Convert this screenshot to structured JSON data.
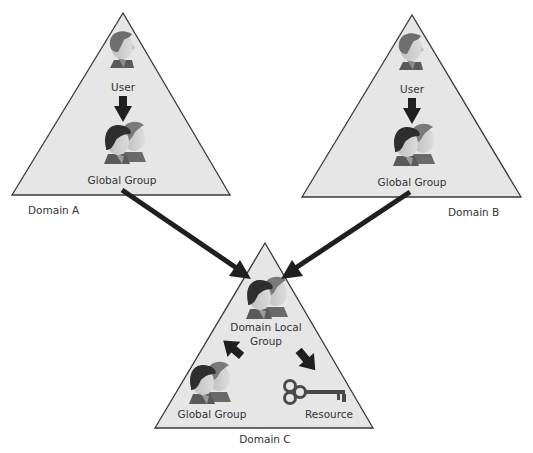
{
  "colors": {
    "triangle_fill": "#e6e6e6",
    "triangle_stroke": "#3a3a3a",
    "arrow": "#1f1f1f",
    "text": "#333333",
    "hair_dark": "#2e2e2e",
    "hair_mid": "#6e6e6e",
    "skin": "#c8c8c8",
    "shirt": "#5a5a5a",
    "key": "#4a4a4a"
  },
  "domains": [
    {
      "id": "A",
      "label": "Domain A",
      "nodes": [
        {
          "type": "user",
          "label": "User"
        },
        {
          "type": "global-group",
          "label": "Global Group"
        }
      ]
    },
    {
      "id": "B",
      "label": "Domain B",
      "nodes": [
        {
          "type": "user",
          "label": "User"
        },
        {
          "type": "global-group",
          "label": "Global Group"
        }
      ]
    },
    {
      "id": "C",
      "label": "Domain C",
      "nodes": [
        {
          "type": "domain-local-group",
          "label_line1": "Domain Local",
          "label_line2": "Group"
        },
        {
          "type": "global-group",
          "label": "Global Group"
        },
        {
          "type": "resource",
          "label": "Resource"
        }
      ]
    }
  ],
  "edges": [
    {
      "from": "A.User",
      "to": "A.Global Group"
    },
    {
      "from": "B.User",
      "to": "B.Global Group"
    },
    {
      "from": "A.Global Group",
      "to": "C.Domain Local Group"
    },
    {
      "from": "B.Global Group",
      "to": "C.Domain Local Group"
    },
    {
      "from": "C.Global Group",
      "to": "C.Domain Local Group"
    },
    {
      "from": "C.Domain Local Group",
      "to": "C.Resource"
    }
  ]
}
